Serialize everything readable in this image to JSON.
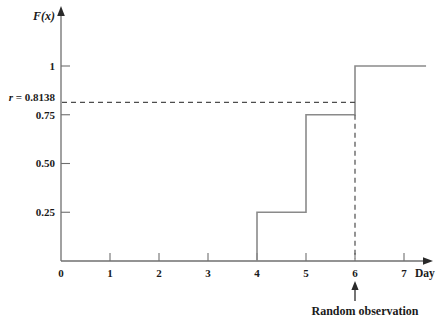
{
  "chart_data": {
    "type": "line",
    "style": "step-cdf",
    "title": "",
    "xlabel": "Day",
    "ylabel": "F(x)",
    "xlim": [
      0,
      7.5
    ],
    "ylim": [
      0,
      1.15
    ],
    "grid": false,
    "x_ticks": [
      0,
      1,
      2,
      3,
      4,
      5,
      6,
      7
    ],
    "x_tick_labels": [
      "0",
      "1",
      "2",
      "3",
      "4",
      "5",
      "6",
      "7"
    ],
    "y_ticks": [
      0.25,
      0.5,
      0.75,
      1
    ],
    "y_tick_labels": [
      "0.25",
      "0.50",
      "0.75",
      "1"
    ],
    "step_points": [
      [
        4,
        0
      ],
      [
        4,
        0.25
      ],
      [
        5,
        0.25
      ],
      [
        5,
        0.75
      ],
      [
        6,
        0.75
      ],
      [
        6,
        1
      ],
      [
        7.45,
        1
      ]
    ],
    "r_line": {
      "value": 0.8138,
      "label_var": "r",
      "label_eq": "= 0.8138",
      "x_end": 6,
      "v_from": 0.75
    },
    "annotation": {
      "text": "Random observation",
      "x": 6
    },
    "colors": {
      "curve": "#8a8a8a",
      "axis": "#6f6f6f",
      "dashed": "#4d4d4d",
      "arrow": "#2a2a2a",
      "text": "#1a1a1a"
    }
  }
}
